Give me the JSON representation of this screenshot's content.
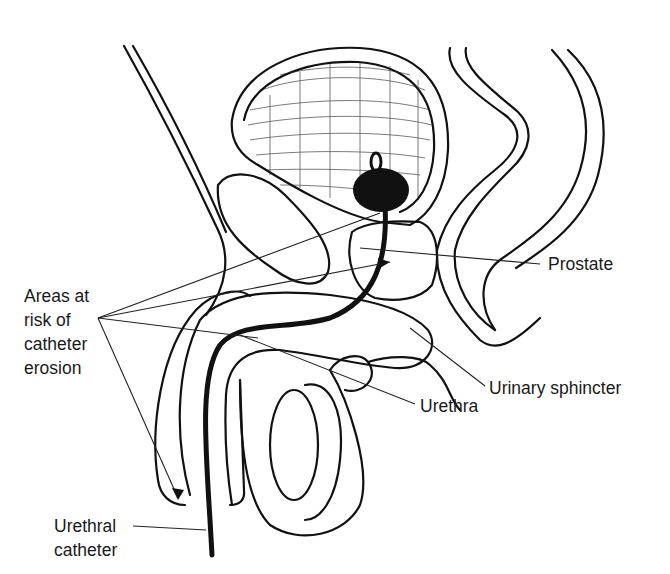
{
  "figure": {
    "type": "anatomical-line-drawing",
    "colors": {
      "ink": "#111111",
      "background": "#ffffff",
      "label_text": "#1a1a1a"
    }
  },
  "labels": {
    "areas_at_risk": "Areas at\nrisk of\ncatheter\nerosion",
    "prostate": "Prostate",
    "urinary_sphincter": "Urinary sphincter",
    "urethra": "Urethra",
    "urethral_catheter": "Urethral\ncatheter"
  },
  "structures": [
    {
      "name": "bladder",
      "labeled": false
    },
    {
      "name": "catheter-balloon",
      "labeled": false
    },
    {
      "name": "pubic-bone",
      "labeled": false
    },
    {
      "name": "prostate",
      "labeled": true
    },
    {
      "name": "urinary-sphincter",
      "labeled": true
    },
    {
      "name": "urethra",
      "labeled": true
    },
    {
      "name": "penis-corpus",
      "labeled": false
    },
    {
      "name": "testis",
      "labeled": false
    },
    {
      "name": "rectum",
      "labeled": false
    },
    {
      "name": "urethral-catheter",
      "labeled": true
    }
  ],
  "leader_lines": {
    "areas_at_risk_origin": [
      98,
      318
    ],
    "areas_at_risk_targets": [
      [
        380,
        213
      ],
      [
        390,
        262
      ],
      [
        258,
        338
      ],
      [
        178,
        500
      ]
    ],
    "prostate": {
      "from": [
        540,
        264
      ],
      "to": [
        360,
        248
      ]
    },
    "urinary_sphincter": {
      "from": [
        485,
        386
      ],
      "to": [
        410,
        328
      ]
    },
    "urethra": {
      "from": [
        415,
        404
      ],
      "to": [
        240,
        335
      ]
    },
    "urethral_catheter": {
      "from": [
        133,
        526
      ],
      "to": [
        206,
        530
      ]
    }
  }
}
